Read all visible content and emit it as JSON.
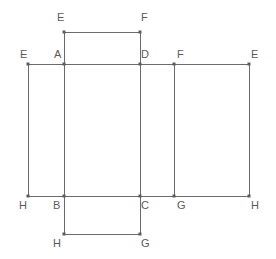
{
  "figure": {
    "type": "geometry-net-diagram",
    "canvas": {
      "width": 276,
      "height": 259
    },
    "colors": {
      "background": "#ffffff",
      "edge_stroke": "#6b6b6b",
      "vertex_dot": "#5c5c5c",
      "label_text": "#5a5a5a"
    }
  },
  "labels": [
    {
      "id": "label-top-e",
      "text": "E",
      "x": 57,
      "y": 12
    },
    {
      "id": "label-top-f",
      "text": "F",
      "x": 141,
      "y": 12
    },
    {
      "id": "label-left-e",
      "text": "E",
      "x": 20,
      "y": 49
    },
    {
      "id": "label-a",
      "text": "A",
      "x": 54,
      "y": 49
    },
    {
      "id": "label-d",
      "text": "D",
      "x": 141,
      "y": 49
    },
    {
      "id": "label-f-right",
      "text": "F",
      "x": 177,
      "y": 49
    },
    {
      "id": "label-right-e",
      "text": "E",
      "x": 251,
      "y": 49
    },
    {
      "id": "label-left-h",
      "text": "H",
      "x": 19,
      "y": 200
    },
    {
      "id": "label-b",
      "text": "B",
      "x": 53,
      "y": 200
    },
    {
      "id": "label-c",
      "text": "C",
      "x": 141,
      "y": 200
    },
    {
      "id": "label-g-right",
      "text": "G",
      "x": 177,
      "y": 200
    },
    {
      "id": "label-right-h",
      "text": "H",
      "x": 251,
      "y": 200
    },
    {
      "id": "label-bottom-h",
      "text": "H",
      "x": 53,
      "y": 238
    },
    {
      "id": "label-bottom-g",
      "text": "G",
      "x": 141,
      "y": 238
    }
  ],
  "edges": [
    {
      "id": "edge-top-flap-top",
      "x1": 64,
      "y1": 32,
      "x2": 140,
      "y2": 32
    },
    {
      "id": "edge-top-flap-left",
      "x1": 64,
      "y1": 32,
      "x2": 64,
      "y2": 64
    },
    {
      "id": "edge-top-flap-right",
      "x1": 140,
      "y1": 32,
      "x2": 140,
      "y2": 64
    },
    {
      "id": "edge-main-top",
      "x1": 28,
      "y1": 64,
      "x2": 249,
      "y2": 64
    },
    {
      "id": "edge-main-bottom",
      "x1": 28,
      "y1": 196,
      "x2": 249,
      "y2": 196
    },
    {
      "id": "edge-left-panel-left",
      "x1": 28,
      "y1": 64,
      "x2": 28,
      "y2": 196
    },
    {
      "id": "edge-a-b",
      "x1": 64,
      "y1": 64,
      "x2": 64,
      "y2": 196
    },
    {
      "id": "edge-d-c",
      "x1": 140,
      "y1": 64,
      "x2": 140,
      "y2": 196
    },
    {
      "id": "edge-f-g",
      "x1": 174,
      "y1": 64,
      "x2": 174,
      "y2": 196
    },
    {
      "id": "edge-right-panel-right",
      "x1": 249,
      "y1": 64,
      "x2": 249,
      "y2": 196
    },
    {
      "id": "edge-bottom-flap-left",
      "x1": 64,
      "y1": 196,
      "x2": 64,
      "y2": 234
    },
    {
      "id": "edge-bottom-flap-right",
      "x1": 140,
      "y1": 196,
      "x2": 140,
      "y2": 234
    },
    {
      "id": "edge-bottom-flap-bottom",
      "x1": 64,
      "y1": 234,
      "x2": 140,
      "y2": 234
    }
  ],
  "vertices": [
    {
      "id": "vertex-top-e",
      "x": 64,
      "y": 32
    },
    {
      "id": "vertex-top-f",
      "x": 140,
      "y": 32
    },
    {
      "id": "vertex-left-e",
      "x": 28,
      "y": 64
    },
    {
      "id": "vertex-a",
      "x": 64,
      "y": 64
    },
    {
      "id": "vertex-d",
      "x": 140,
      "y": 64
    },
    {
      "id": "vertex-f-right",
      "x": 174,
      "y": 64
    },
    {
      "id": "vertex-right-e",
      "x": 249,
      "y": 64
    },
    {
      "id": "vertex-left-h",
      "x": 28,
      "y": 196
    },
    {
      "id": "vertex-b",
      "x": 64,
      "y": 196
    },
    {
      "id": "vertex-c",
      "x": 140,
      "y": 196
    },
    {
      "id": "vertex-g-right",
      "x": 174,
      "y": 196
    },
    {
      "id": "vertex-right-h",
      "x": 249,
      "y": 196
    },
    {
      "id": "vertex-bottom-h",
      "x": 64,
      "y": 234
    },
    {
      "id": "vertex-bottom-g",
      "x": 140,
      "y": 234
    }
  ]
}
